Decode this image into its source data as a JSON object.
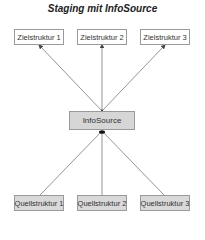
{
  "title": "Staging mit InfoSource",
  "targets": [
    {
      "label": "Zielstruktur 1"
    },
    {
      "label": "Zielstruktur 2"
    },
    {
      "label": "Zielstruktur 3"
    }
  ],
  "hub": {
    "label": "InfoSource"
  },
  "sources": [
    {
      "label": "Quellstruktur 1"
    },
    {
      "label": "Quellstruktur 2"
    },
    {
      "label": "Quellstruktur 3"
    }
  ],
  "colors": {
    "line": "#7a7a7a",
    "box_border": "#9a9a9a",
    "source_fill": "#d9d9d9",
    "target_fill": "#ffffff"
  }
}
